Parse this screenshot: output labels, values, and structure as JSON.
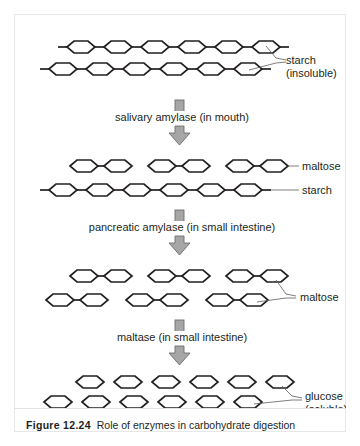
{
  "figure": {
    "caption_number": "Figure 12.24",
    "caption_text": "Role of enzymes in carbohydrate digestion",
    "border_color": "#e7e7e7",
    "ink_color": "#231f20",
    "arrow_fill": "#a6a6a6",
    "arrow_stroke": "#6e6e6e",
    "background": "#ffffff"
  },
  "stages": [
    {
      "id": "stage-starch",
      "label_lines": [
        "starch",
        "(insoluble)"
      ],
      "label_name": "starch-insoluble-label",
      "description": "two long starch chains of six linked hexagon units each, with open bonds at both ends",
      "rows": [
        {
          "type": "chain",
          "units": 6,
          "open_left": true,
          "open_right": true
        },
        {
          "type": "chain",
          "units": 6,
          "open_left": true,
          "open_right": true
        }
      ]
    },
    {
      "id": "stage-maltose-and-starch",
      "label_lines": [
        "maltose",
        "starch"
      ],
      "labels": [
        {
          "text": "maltose",
          "name": "maltose-label-1"
        },
        {
          "text": "starch",
          "name": "starch-label-2"
        }
      ],
      "description": "three separate maltose pairs above one remaining six-unit starch chain",
      "rows": [
        {
          "type": "pairs",
          "groups": 3,
          "units_per_group": 2
        },
        {
          "type": "chain",
          "units": 6,
          "open_left": true,
          "open_right": true
        }
      ]
    },
    {
      "id": "stage-maltose-all",
      "label_lines": [
        "maltose"
      ],
      "label_name": "maltose-label-2",
      "description": "six separate maltose pairs arranged in two rows of three",
      "rows": [
        {
          "type": "pairs",
          "groups": 3,
          "units_per_group": 2
        },
        {
          "type": "pairs",
          "groups": 3,
          "units_per_group": 2
        }
      ]
    },
    {
      "id": "stage-glucose",
      "label_lines": [
        "glucose",
        "(soluble)"
      ],
      "label_name": "glucose-soluble-label",
      "description": "twelve separate single glucose hexagons in two rows of six",
      "rows": [
        {
          "type": "singles",
          "units": 6
        },
        {
          "type": "singles",
          "units": 6
        }
      ]
    }
  ],
  "enzyme_steps": [
    {
      "id": "step-salivary",
      "label": "salivary amylase (in mouth)",
      "name": "enzyme-label-salivary-amylase"
    },
    {
      "id": "step-pancreatic",
      "label": "pancreatic amylase (in small intestine)",
      "name": "enzyme-label-pancreatic-amylase"
    },
    {
      "id": "step-maltase",
      "label": "maltase (in small intestine)",
      "name": "enzyme-label-maltase"
    }
  ]
}
